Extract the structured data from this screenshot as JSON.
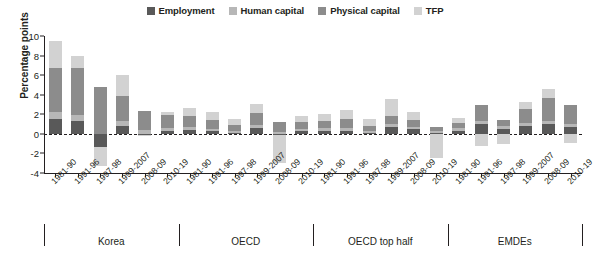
{
  "chart_data": {
    "type": "bar",
    "stacked": true,
    "title": "",
    "xlabel": "",
    "ylabel": "Percentage points",
    "ylim": [
      -4,
      10
    ],
    "yticks": [
      10,
      8,
      6,
      4,
      2,
      0,
      -2,
      -4
    ],
    "grid": false,
    "legend_position": "top-center",
    "zero_line": true,
    "series": [
      {
        "name": "Employment",
        "color": "#595959"
      },
      {
        "name": "Human capital",
        "color": "#b7b7b7"
      },
      {
        "name": "Physical capital",
        "color": "#8c8c8c"
      },
      {
        "name": "TFP",
        "color": "#d2d2d2"
      }
    ],
    "groups": [
      {
        "name": "Korea",
        "categories": [
          "1981-90",
          "1991-96",
          "1997-98",
          "1999-2007",
          "2008-09",
          "2010-19"
        ],
        "values": {
          "Employment": [
            1.5,
            1.3,
            -1.3,
            0.8,
            -0.1,
            0.3
          ],
          "Human capital": [
            0.7,
            0.6,
            0.0,
            0.5,
            0.4,
            0.3
          ],
          "Physical capital": [
            4.5,
            4.8,
            4.8,
            2.6,
            1.9,
            1.3
          ],
          "TFP": [
            2.8,
            1.3,
            -2.0,
            2.1,
            -0.1,
            0.3
          ]
        },
        "totals": [
          9.5,
          8.0,
          -3.4,
          6.0,
          2.2,
          2.2
        ]
      },
      {
        "name": "OECD",
        "categories": [
          "1981-90",
          "1991-96",
          "1997-98",
          "1999-2007",
          "2008-09",
          "2010-19"
        ],
        "values": {
          "Employment": [
            0.4,
            0.3,
            0.1,
            0.6,
            -0.1,
            0.3
          ],
          "Human capital": [
            0.3,
            0.2,
            0.2,
            0.3,
            0.2,
            0.2
          ],
          "Physical capital": [
            1.1,
            0.9,
            0.6,
            1.2,
            1.0,
            0.7
          ],
          "TFP": [
            0.8,
            0.8,
            0.6,
            1.0,
            -2.9,
            0.6
          ]
        },
        "totals": [
          2.6,
          2.2,
          1.5,
          3.1,
          -1.8,
          1.8
        ]
      },
      {
        "name": "OECD top half",
        "categories": [
          "1981-90",
          "1991-96",
          "1997-98",
          "1999-2007",
          "2008-09",
          "2010-19"
        ],
        "values": {
          "Employment": [
            0.3,
            0.3,
            0.1,
            0.7,
            0.5,
            0.1
          ],
          "Human capital": [
            0.3,
            0.3,
            0.2,
            0.3,
            0.2,
            0.2
          ],
          "Physical capital": [
            0.7,
            0.9,
            0.5,
            0.8,
            0.7,
            0.4
          ],
          "TFP": [
            0.7,
            0.9,
            0.7,
            1.8,
            0.8,
            -2.5
          ]
        },
        "totals": [
          2.0,
          2.4,
          1.5,
          3.6,
          2.2,
          -1.8
        ]
      },
      {
        "name": "EMDEs",
        "categories": [
          "1981-90",
          "1991-96",
          "1997-98",
          "1999-2007",
          "2008-09",
          "2010-19"
        ],
        "values": {
          "Employment": [
            0.3,
            1.0,
            0.5,
            0.8,
            1.0,
            0.7
          ],
          "Human capital": [
            0.3,
            0.3,
            0.3,
            0.3,
            0.3,
            0.3
          ],
          "Physical capital": [
            0.5,
            1.6,
            0.6,
            1.4,
            2.4,
            1.9
          ],
          "TFP": [
            0.5,
            -1.2,
            -1.0,
            0.8,
            0.9,
            -0.9
          ]
        },
        "totals": [
          1.6,
          1.7,
          0.4,
          3.3,
          4.6,
          2.0
        ]
      }
    ]
  }
}
